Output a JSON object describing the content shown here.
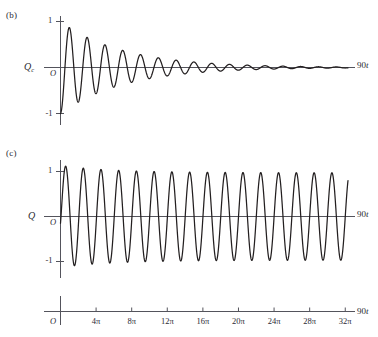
{
  "figure": {
    "background_color": "#ffffff",
    "ink_color": "#231f20",
    "axis_color": "#54545c"
  },
  "panels": [
    {
      "tag": "(b)",
      "ylabel": "Q",
      "ylabel_sub": "c",
      "origin_label": "O",
      "end_label_number": "90",
      "end_label_variable": "t",
      "ytick_labels": [
        "1",
        "-1"
      ]
    },
    {
      "tag": "(c)",
      "ylabel": "Q",
      "ylabel_sub": "",
      "origin_label": "O",
      "end_label_number": "90",
      "end_label_variable": "t",
      "ytick_labels": [
        "1",
        "-1"
      ]
    }
  ],
  "xaxis": {
    "origin_label": "O",
    "end_label_number": "90",
    "end_label_variable": "t",
    "tick_labels": [
      "4π",
      "8π",
      "12π",
      "16π",
      "20π",
      "24π",
      "28π",
      "32π"
    ],
    "tick_values": [
      12.566,
      25.133,
      37.699,
      50.265,
      62.832,
      75.398,
      87.965,
      100.531
    ]
  },
  "chart_data": [
    {
      "type": "line",
      "id": "panel-b-transient",
      "title": "(b)",
      "xlabel": "90t",
      "ylabel": "Q_c",
      "xlim": [
        0,
        104.0
      ],
      "ylim": [
        -1.3,
        1.3
      ],
      "yticks": [
        -1,
        1
      ],
      "xticks": [
        12.566,
        25.133,
        37.699,
        50.265,
        62.832,
        75.398,
        87.965,
        100.531
      ],
      "grid": false,
      "legend": null,
      "description": "Damped (transient) oscillation decaying from -1 toward zero",
      "formula": "y = -exp(-0.045*x)*cos(x*1.0)",
      "series": [
        {
          "name": "Qc transient",
          "color": "#231f20",
          "amplitude_start": 1.0,
          "amplitude_end": 0.05,
          "decay_constant": 0.045,
          "angular_frequency": 1.0,
          "phase": 3.14159,
          "start_value": -1.0
        }
      ]
    },
    {
      "type": "line",
      "id": "panel-c-total",
      "title": "(c)",
      "xlabel": "90t",
      "ylabel": "Q",
      "xlim": [
        0,
        104.0
      ],
      "ylim": [
        -1.45,
        1.45
      ],
      "yticks": [
        -1,
        1
      ],
      "xticks": [
        12.566,
        25.133,
        37.699,
        50.265,
        62.832,
        75.398,
        87.965,
        100.531
      ],
      "grid": false,
      "legend": null,
      "description": "Sum of steady-state and transient: amplitude rises to ~1.25 near 8pi then settles to ~1.0",
      "formula": "y = sin(x) - exp(-0.045*x)*cos(x)",
      "series": [
        {
          "name": "Q total",
          "color": "#231f20",
          "steady_amplitude": 1.0,
          "peak_amplitude": 1.25,
          "peak_location": "8π",
          "start_value": 0.15,
          "end_value": 0.65,
          "angular_frequency": 1.0
        }
      ]
    }
  ]
}
